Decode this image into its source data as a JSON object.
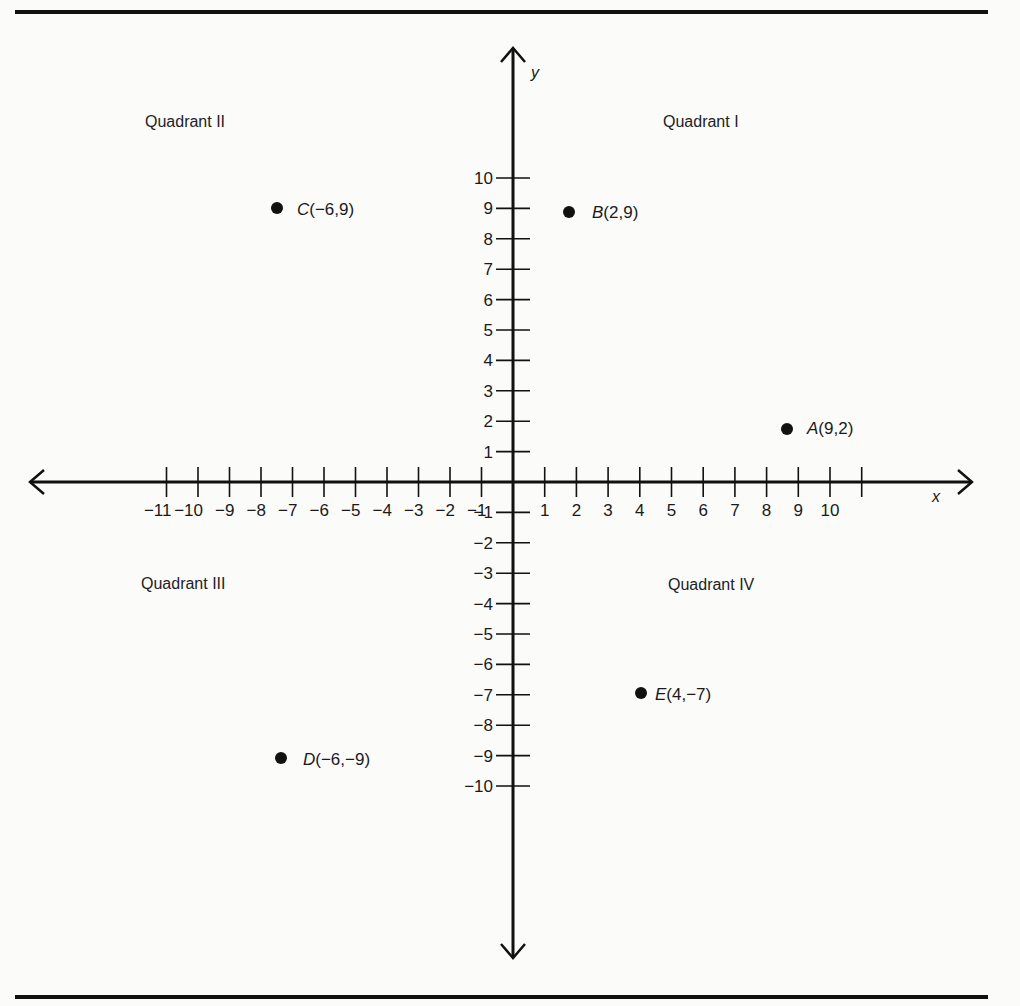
{
  "chart_data": {
    "type": "scatter",
    "title": "",
    "xlabel": "x",
    "ylabel": "y",
    "xlim": [
      -11,
      10
    ],
    "ylim": [
      -10,
      10
    ],
    "grid": false,
    "x_ticks": [
      -11,
      -10,
      -9,
      -8,
      -7,
      -6,
      -5,
      -4,
      -3,
      -2,
      -1,
      1,
      2,
      3,
      4,
      5,
      6,
      7,
      8,
      9,
      10
    ],
    "x_tick_labels": [
      "−11",
      "−10",
      "−9",
      "−8",
      "−7",
      "−6",
      "−5",
      "−4",
      "−3",
      "−2",
      "−1",
      "1",
      "2",
      "3",
      "4",
      "5",
      "6",
      "7",
      "8",
      "9",
      "10"
    ],
    "y_ticks": [
      10,
      9,
      8,
      7,
      6,
      5,
      4,
      3,
      2,
      1,
      -1,
      -2,
      -3,
      -4,
      -5,
      -6,
      -7,
      -8,
      -9,
      -10
    ],
    "y_tick_labels": [
      "10",
      "9",
      "8",
      "7",
      "6",
      "5",
      "4",
      "3",
      "2",
      "1",
      "−1",
      "−2",
      "−3",
      "−4",
      "−5",
      "−6",
      "−7",
      "−8",
      "−9",
      "−10"
    ],
    "points": [
      {
        "name": "A",
        "x": 9,
        "y": 2,
        "label": "A(9,2)",
        "coords": "(9,2)"
      },
      {
        "name": "B",
        "x": 2,
        "y": 9,
        "label": "B(2,9)",
        "coords": "(2,9)"
      },
      {
        "name": "C",
        "x": -6,
        "y": 9,
        "label": "C(−6,9)",
        "coords": "(−6,9)"
      },
      {
        "name": "D",
        "x": -6,
        "y": -9,
        "label": "D(−6,−9)",
        "coords": "(−6,−9)"
      },
      {
        "name": "E",
        "x": 4,
        "y": -7,
        "label": "E(4,−7)",
        "coords": "(4,−7)"
      }
    ],
    "annotations": [
      {
        "text": "Quadrant I",
        "region": "upper-right"
      },
      {
        "text": "Quadrant II",
        "region": "upper-left"
      },
      {
        "text": "Quadrant III",
        "region": "lower-left"
      },
      {
        "text": "Quadrant IV",
        "region": "lower-right"
      }
    ]
  },
  "quadrants": {
    "q1": "Quadrant I",
    "q2": "Quadrant II",
    "q3": "Quadrant III",
    "q4": "Quadrant IV"
  },
  "axes": {
    "x_name": "x",
    "y_name": "y"
  },
  "points": {
    "A": {
      "letter": "A",
      "coords": "(9,2)"
    },
    "B": {
      "letter": "B",
      "coords": "(2,9)"
    },
    "C": {
      "letter": "C",
      "coords": "(−6,9)"
    },
    "D": {
      "letter": "D",
      "coords": "(−6,−9)"
    },
    "E": {
      "letter": "E",
      "coords": "(4,−7)"
    }
  },
  "colors": {
    "ink": "#111111",
    "paper": "#fbfbfa"
  }
}
